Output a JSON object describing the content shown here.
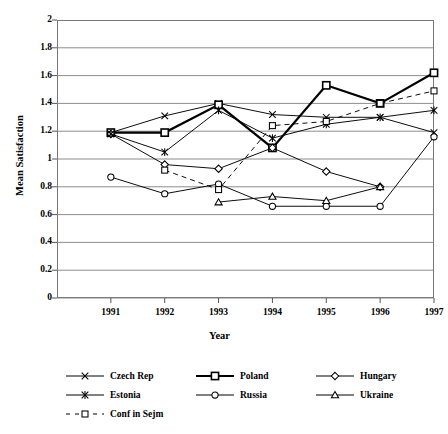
{
  "chart_data": {
    "type": "line",
    "title": "",
    "xlabel": "Year",
    "ylabel": "Mean Satisfaction",
    "x": [
      1991,
      1992,
      1993,
      1994,
      1995,
      1996,
      1997
    ],
    "categories": [
      "1991",
      "1992",
      "1993",
      "1994",
      "1995",
      "1996",
      "1997"
    ],
    "xlim": [
      1990.5,
      1997.5
    ],
    "ylim": [
      0,
      2
    ],
    "yticks": [
      0,
      0.2,
      0.4,
      0.6,
      0.8,
      1,
      1.2,
      1.4,
      1.6,
      1.8,
      2
    ],
    "ytick_labels": [
      "0",
      "0.2",
      "0.4",
      "0.6",
      "0.8",
      "1",
      "1.2",
      "1.4",
      "1.6",
      "1.8",
      "2"
    ],
    "grid": "horizontal",
    "legend_position": "below",
    "series": [
      {
        "name": "Czech Rep",
        "marker": "x",
        "line": "solid",
        "weight": "thin",
        "x": [
          1991,
          1992,
          1993,
          1994,
          1995,
          1996,
          1997
        ],
        "values": [
          1.19,
          1.31,
          1.4,
          1.32,
          1.3,
          1.3,
          1.19
        ]
      },
      {
        "name": "Poland",
        "marker": "square",
        "line": "solid",
        "weight": "bold",
        "x": [
          1991,
          1992,
          1993,
          1994,
          1995,
          1996,
          1997
        ],
        "values": [
          1.19,
          1.19,
          1.39,
          1.08,
          1.53,
          1.4,
          1.62
        ]
      },
      {
        "name": "Hungary",
        "marker": "diamond",
        "line": "solid",
        "weight": "thin",
        "x": [
          1991,
          1992,
          1993,
          1994,
          1995,
          1996,
          1997
        ],
        "values": [
          1.18,
          0.96,
          0.93,
          1.08,
          0.91,
          0.8,
          null
        ]
      },
      {
        "name": "Estonia",
        "marker": "asterisk",
        "line": "solid",
        "weight": "thin",
        "x": [
          1991,
          1992,
          1993,
          1994,
          1995,
          1996,
          1997
        ],
        "values": [
          1.18,
          1.05,
          1.35,
          1.15,
          1.25,
          1.3,
          1.35
        ]
      },
      {
        "name": "Russia",
        "marker": "circle",
        "line": "solid",
        "weight": "thin",
        "x": [
          1991,
          1992,
          1993,
          1994,
          1995,
          1996,
          1997
        ],
        "values": [
          0.87,
          0.75,
          0.82,
          0.66,
          0.66,
          0.66,
          1.16
        ]
      },
      {
        "name": "Ukraine",
        "marker": "triangle",
        "line": "solid",
        "weight": "thin",
        "x": [
          1993,
          1994,
          1995,
          1996
        ],
        "values": [
          0.69,
          0.73,
          0.7,
          0.8
        ]
      },
      {
        "name": "Conf in Sejm",
        "marker": "square",
        "line": "dashed",
        "weight": "thin",
        "x": [
          1992,
          1993,
          1994,
          1995,
          1996,
          1997
        ],
        "values": [
          0.92,
          0.78,
          1.24,
          1.27,
          1.4,
          1.49
        ]
      }
    ]
  },
  "axes": {
    "y_title": "Mean Satisfaction",
    "x_title": "Year"
  },
  "legend": {
    "entries": [
      {
        "label": "Czech Rep",
        "marker": "x-marker-icon",
        "line": "solid",
        "weight": "thin"
      },
      {
        "label": "Poland",
        "marker": "square-marker-icon",
        "line": "solid",
        "weight": "bold"
      },
      {
        "label": "Hungary",
        "marker": "diamond-marker-icon",
        "line": "solid",
        "weight": "thin"
      },
      {
        "label": "Estonia",
        "marker": "asterisk-marker-icon",
        "line": "solid",
        "weight": "thin"
      },
      {
        "label": "Russia",
        "marker": "circle-marker-icon",
        "line": "solid",
        "weight": "thin"
      },
      {
        "label": "Ukraine",
        "marker": "triangle-marker-icon",
        "line": "solid",
        "weight": "thin"
      },
      {
        "label": "Conf in Sejm",
        "marker": "square-marker-icon",
        "line": "dashed",
        "weight": "thin"
      }
    ]
  },
  "colors": {
    "line": "#000000",
    "grid": "#808080",
    "frame": "#777777",
    "background": "#ffffff"
  }
}
